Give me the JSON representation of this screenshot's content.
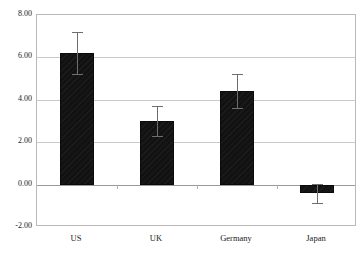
{
  "chart_data": {
    "type": "bar",
    "title": "",
    "subtitle": "",
    "xlabel": "",
    "ylabel": "",
    "categories": [
      "US",
      "UK",
      "Germany",
      "Japan"
    ],
    "values": [
      6.2,
      3.0,
      4.4,
      -0.4
    ],
    "errors": [
      1.0,
      0.7,
      0.8,
      0.45
    ],
    "series": [
      {
        "name": "",
        "values": [
          6.2,
          3.0,
          4.4,
          -0.4
        ],
        "errors": [
          1.0,
          0.7,
          0.8,
          0.45
        ]
      }
    ],
    "ylim": [
      -2.0,
      8.0
    ],
    "ytick_values": [
      8.0,
      6.0,
      4.0,
      2.0,
      0.0,
      -2.0
    ],
    "ytick_labels": [
      "8.00",
      "6.00",
      "4.00",
      "2.00",
      "0.00",
      "-2.00"
    ],
    "grid": true,
    "grid_axis": "y",
    "legend": false,
    "legend_position": "none",
    "bar_color": "#121212",
    "bar_edge_color": "#0a0a0a",
    "error_bar_color": "#6e6e6e",
    "gridline_color": "#c9c9c9",
    "zero_line_color": "#9a9a9a",
    "frame_color": "#b9b9b9",
    "background_color": "#ffffff",
    "text_color": "#1a1a1a",
    "annotations": []
  },
  "axes": {
    "y_tick_labels": [
      "8.00",
      "6.00",
      "4.00",
      "2.00",
      "0.00",
      "-2.00"
    ],
    "x_tick_labels": [
      "US",
      "UK",
      "Germany",
      "Japan"
    ]
  }
}
